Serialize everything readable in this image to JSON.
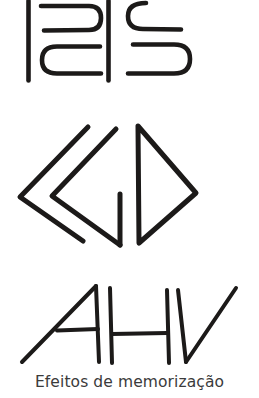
{
  "caption": {
    "text": "Efeitos de memorização"
  },
  "colors": {
    "background": "#ffffff",
    "ink": "#1c1a19",
    "caption_text": "#3b3b3b"
  },
  "figures": [
    {
      "id": "figure-1",
      "label": "abstract-glyph-pair-top",
      "description": "Two hand-drawn angular glyphs: a bracket-like form with vertical stems and two rounded hooks, beside an S-shaped form with squared rounded hooks",
      "stroke_width": 4.6
    },
    {
      "id": "figure-2",
      "label": "abstract-chevrons-and-triangle-middle",
      "description": "Two nested left-pointing chevrons followed by a right-pointing open triangle",
      "stroke_width": 5.0
    },
    {
      "id": "figure-3",
      "label": "abstract-letters-ahv-bottom",
      "description": "Slanted hand-drawn letterforms reading A H V",
      "stroke_width": 4.0
    }
  ]
}
